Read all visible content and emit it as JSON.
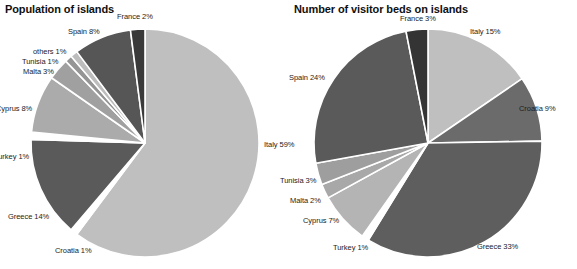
{
  "charts": [
    {
      "title": "Population of islands",
      "center": [
        145,
        143
      ],
      "radius": 114,
      "labels": [
        {
          "text": "France 2%",
          "x": 117,
          "y": 12,
          "align": "left"
        },
        {
          "text": "Spain 8%",
          "x": 68,
          "y": 27,
          "align": "left"
        },
        {
          "text": "others 1%",
          "x": 33,
          "y": 47,
          "align": "left"
        },
        {
          "text": "Tunisia 1%",
          "x": 22,
          "y": 57,
          "align": "left"
        },
        {
          "text": "Malta 3%",
          "x": 23,
          "y": 67,
          "align": "left"
        },
        {
          "text": "Cyprus 8%",
          "x": -4,
          "y": 104,
          "align": "left"
        },
        {
          "text": "Turkey 1%",
          "x": -6,
          "y": 152,
          "align": "left"
        },
        {
          "text": "Greece 14%",
          "x": 8,
          "y": 212,
          "align": "left"
        },
        {
          "text": "Croatia 1%",
          "x": 55,
          "y": 246,
          "align": "left"
        },
        {
          "text": "Italy 59%",
          "x": 264,
          "y": 140,
          "align": "left"
        }
      ]
    },
    {
      "title": "Number of visitor beds on islands",
      "center": [
        428,
        143
      ],
      "radius": 114,
      "labels": [
        {
          "text": "France 3%",
          "x": 400,
          "y": 14,
          "align": "left"
        },
        {
          "text": "Italy 15%",
          "x": 470,
          "y": 27,
          "align": "left"
        },
        {
          "text": "Croatia 9%",
          "x": 519,
          "y": 104,
          "align": "left"
        },
        {
          "text": "Greece 33%",
          "x": 477,
          "y": 242,
          "align": "left"
        },
        {
          "text": "Turkey 1%",
          "x": 333,
          "y": 243,
          "align": "left"
        },
        {
          "text": "Cyprus 7%",
          "x": 303,
          "y": 216,
          "align": "left"
        },
        {
          "text": "Malta 2%",
          "x": 290,
          "y": 196,
          "align": "left"
        },
        {
          "text": "Tunisia 3%",
          "x": 280,
          "y": 176,
          "align": "left"
        },
        {
          "text": "Spain 24%",
          "x": 289,
          "y": 73,
          "align": "left"
        }
      ]
    }
  ],
  "chart_data": [
    {
      "type": "pie",
      "title": "Population of islands",
      "xlabel": "",
      "ylabel": "",
      "legend": "none",
      "grid": false,
      "units": "percent",
      "categories": [
        "Italy",
        "Croatia",
        "Greece",
        "Turkey",
        "Cyprus",
        "Malta",
        "Tunisia",
        "others",
        "Spain",
        "France"
      ],
      "values": [
        59,
        1,
        14,
        1,
        8,
        3,
        1,
        1,
        8,
        2
      ],
      "data_labels": [
        "Italy 59%",
        "Croatia 1%",
        "Greece 14%",
        "Turkey 1%",
        "Cyprus 8%",
        "Malta 3%",
        "Tunisia 1%",
        "others 1%",
        "Spain 8%",
        "France 2%"
      ],
      "slice_colors": [
        "#bfbfbf",
        "#ffffff",
        "#5a5a5a",
        "#ffffff",
        "#ababab",
        "#a0a0a0",
        "#959595",
        "#bdbdbd",
        "#565656",
        "#3a3a3a"
      ],
      "start_angle_deg": 0,
      "direction": "clockwise",
      "separator_color": "#ffffff"
    },
    {
      "type": "pie",
      "title": "Number of visitor beds on islands",
      "xlabel": "",
      "ylabel": "",
      "legend": "none",
      "grid": false,
      "units": "percent",
      "categories": [
        "Italy",
        "Croatia",
        "Greece",
        "Turkey",
        "Cyprus",
        "Malta",
        "Tunisia",
        "Spain",
        "France"
      ],
      "values": [
        15,
        9,
        33,
        1,
        7,
        2,
        3,
        24,
        3
      ],
      "data_labels": [
        "Italy 15%",
        "Croatia 9%",
        "Greece 33%",
        "Turkey 1%",
        "Cyprus 7%",
        "Malta 2%",
        "Tunisia 3%",
        "Spain 24%",
        "France 3%"
      ],
      "slice_colors": [
        "#bfbfbf",
        "#6b6b6b",
        "#5e5e5e",
        "#ffffff",
        "#b4b4b4",
        "#a8a8a8",
        "#9e9e9e",
        "#5a5a5a",
        "#343434"
      ],
      "start_angle_deg": 0,
      "direction": "clockwise",
      "separator_color": "#ffffff"
    }
  ],
  "colors": {
    "background": "#ffffff",
    "title_text": "#101010",
    "label_text": "#1c1c1c",
    "slice_border": "#ffffff"
  }
}
